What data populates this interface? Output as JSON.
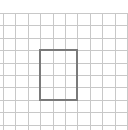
{
  "grid": {
    "color": "#c8c8c8",
    "line_width": 1,
    "origin_x": 3,
    "origin_y": 13,
    "cell_size": 12.4,
    "columns": 10,
    "rows": 10
  },
  "rectangle": {
    "color": "#7a7a7a",
    "line_width": 2,
    "col_start": 3,
    "row_start": 3,
    "col_span": 3,
    "row_span": 4
  }
}
